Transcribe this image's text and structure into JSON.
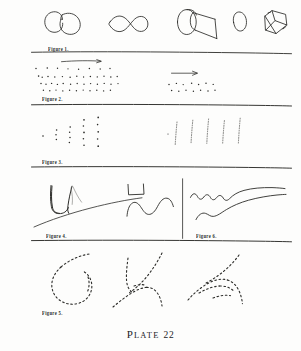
{
  "plate": {
    "title_word": "Plate",
    "title_word_first_letter": "P",
    "title_word_rest": "LATE",
    "title_number": "22",
    "background_color": "#fdfdfc",
    "ink_color": "#2b2b28"
  },
  "figures": [
    {
      "id": "figure-1",
      "label": "Figure 1.",
      "description": "row of outline line-drawings: two overlapping circles, a figure-eight, a cylinder, a small oval, an irregular polygon",
      "shapes": [
        "two-circles",
        "figure-eight",
        "cylinder",
        "small-oval",
        "polygon"
      ]
    },
    {
      "id": "figure-2",
      "label": "Figure 2.",
      "description": "scattered rows of dots with a right-pointing arrow above each cluster",
      "clusters": 2,
      "arrows": 2
    },
    {
      "id": "figure-3",
      "label": "Figure 3.",
      "description": "vertical columns of dots at left and five dotted vertical strokes at right",
      "columns": 5,
      "strokes": 5
    },
    {
      "id": "figure-4",
      "label": "Figure 4.",
      "description": "angular V stroke crossed by a long diagonal line, plus a bracket shape above a wavy line"
    },
    {
      "id": "figure-6",
      "label": "Figure 6.",
      "description": "two hand-drawn wavy horizontal lines"
    },
    {
      "id": "figure-5",
      "label": "Figure 5.",
      "description": "three dotted/dashed outline sketches: a circle, a branching Y form, and an arch form"
    }
  ],
  "rules": {
    "count": 5,
    "orientation": "horizontal",
    "style": "hand-drawn"
  }
}
